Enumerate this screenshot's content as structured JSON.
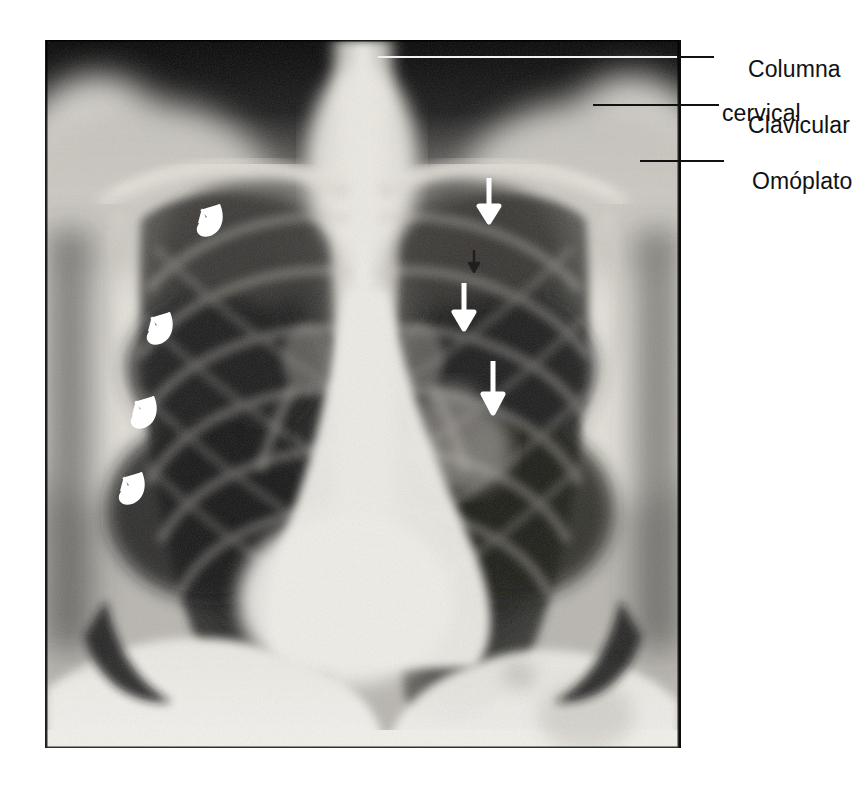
{
  "figure": {
    "kind": "annotated-chest-radiograph",
    "view": "PA chest X-ray",
    "language": "es",
    "plate": {
      "left": 45,
      "top": 40,
      "width": 633,
      "height": 708
    },
    "canvas": {
      "width": 863,
      "height": 796
    },
    "colors": {
      "page_background": "#ffffff",
      "label_text": "#111111",
      "leader_dark": "#111111",
      "leader_light": "#f2f2f2",
      "marker_white": "#ffffff",
      "plate_dark": "#0c0c0c",
      "plate_bright": "#f0efed"
    }
  },
  "labels": [
    {
      "id": "columna-cervical",
      "line1": "Columna",
      "line2": "cervical",
      "text_x": 722,
      "text_y": 36,
      "leader": {
        "x": 378,
        "y": 56,
        "length": 336,
        "tone": "light-then-dark"
      }
    },
    {
      "id": "clavicular",
      "line1": "Clavicular",
      "line2": "",
      "text_x": 722,
      "text_y": 92,
      "leader": {
        "x": 593,
        "y": 104,
        "length": 126,
        "tone": "dark"
      }
    },
    {
      "id": "omoplato",
      "line1": "Omóplato",
      "line2": "",
      "text_x": 726,
      "text_y": 148,
      "leader": {
        "x": 640,
        "y": 160,
        "length": 84,
        "tone": "dark"
      }
    }
  ],
  "markers": {
    "straight_arrows": [
      {
        "id": "arrow-1",
        "x": 489,
        "y": 181,
        "length": 41,
        "color": "#ffffff",
        "direction": "down",
        "region": "right-lung-upper"
      },
      {
        "id": "arrow-2",
        "x": 464,
        "y": 286,
        "length": 43,
        "color": "#ffffff",
        "direction": "down",
        "region": "right-lung-mid"
      },
      {
        "id": "arrow-3",
        "x": 493,
        "y": 364,
        "length": 49,
        "color": "#ffffff",
        "direction": "down",
        "region": "right-lung-lower"
      }
    ],
    "dark_arrow": {
      "id": "arrow-dark",
      "x": 473,
      "y": 252,
      "length": 18,
      "color": "#1d1d1d",
      "direction": "down"
    },
    "curved_arrows": [
      {
        "id": "curved-1",
        "x": 206,
        "y": 212,
        "size": 40,
        "color": "#ffffff",
        "region": "left-lung-upper"
      },
      {
        "id": "curved-2",
        "x": 156,
        "y": 320,
        "size": 40,
        "color": "#ffffff",
        "region": "left-lung-upper-mid"
      },
      {
        "id": "curved-3",
        "x": 140,
        "y": 404,
        "size": 40,
        "color": "#ffffff",
        "region": "left-lung-mid"
      },
      {
        "id": "curved-4",
        "x": 128,
        "y": 480,
        "size": 40,
        "color": "#ffffff",
        "region": "left-lung-lower"
      }
    ]
  }
}
